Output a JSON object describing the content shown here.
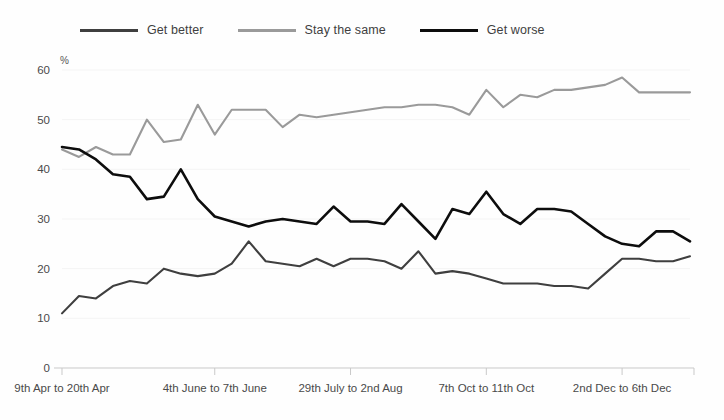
{
  "legend": {
    "items": [
      {
        "label": "Get better",
        "color": "#3f3f3f",
        "key": "get_better"
      },
      {
        "label": "Stay the same",
        "color": "#9a9a9a",
        "key": "stay_the_same"
      },
      {
        "label": "Get worse",
        "color": "#0d0d0d",
        "key": "get_worse"
      }
    ]
  },
  "axes": {
    "y_unit_label": "%",
    "y_ticks": [
      0,
      10,
      20,
      30,
      40,
      50,
      60
    ],
    "x_ticks": [
      {
        "label": "9th Apr to 20th Apr",
        "index": 0
      },
      {
        "label": "4th June to 7th June",
        "index": 9
      },
      {
        "label": "29th July to 2nd Aug",
        "index": 17
      },
      {
        "label": "7th Oct to 11th Oct",
        "index": 25
      },
      {
        "label": "2nd Dec to 6th Dec",
        "index": 33
      }
    ]
  },
  "chart_data": {
    "type": "line",
    "title": "",
    "subtitle": "",
    "xlabel": "",
    "ylabel": "%",
    "ylim": [
      0,
      60
    ],
    "grid": false,
    "legend_position": "top-left",
    "x_tick_labels": [
      "9th Apr to 20th Apr",
      "4th June to 7th June",
      "29th July to 2nd Aug",
      "7th Oct to 11th Oct",
      "2nd Dec to 6th Dec"
    ],
    "x_tick_indices": [
      0,
      9,
      17,
      25,
      33
    ],
    "n_points": 38,
    "series": [
      {
        "name": "Get better",
        "color": "#3f3f3f",
        "values": [
          11,
          14.5,
          14,
          16.5,
          17.5,
          17,
          20,
          19,
          18.5,
          19,
          21,
          25.5,
          21.5,
          21,
          20.5,
          22,
          20.5,
          22,
          22,
          21.5,
          20,
          23.5,
          19,
          19.5,
          19,
          18,
          17,
          17,
          17,
          16.5,
          16.5,
          16,
          19,
          22,
          22,
          21.5,
          21.5,
          22.5
        ]
      },
      {
        "name": "Stay the same",
        "color": "#9a9a9a",
        "values": [
          44,
          42.5,
          44.5,
          43,
          43,
          50,
          45.5,
          46,
          53,
          47,
          52,
          52,
          52,
          48.5,
          51,
          50.5,
          51,
          51.5,
          52,
          52.5,
          52.5,
          53,
          53,
          52.5,
          51,
          56,
          52.5,
          55,
          54.5,
          56,
          56,
          56.5,
          57,
          58.5,
          55.5,
          55.5,
          55.5,
          55.5
        ]
      },
      {
        "name": "Get worse",
        "color": "#0d0d0d",
        "values": [
          44.5,
          44,
          42,
          39,
          38.5,
          34,
          34.5,
          40,
          34,
          30.5,
          29.5,
          28.5,
          29.5,
          30,
          29.5,
          29,
          32.5,
          29.5,
          29.5,
          29,
          33,
          29.5,
          26,
          32,
          31,
          35.5,
          31,
          29,
          32,
          32,
          31.5,
          29,
          26.5,
          25,
          24.5,
          27.5,
          27.5,
          25.5
        ]
      }
    ]
  },
  "plot_geometry": {
    "left": 62,
    "right": 690,
    "top": 70,
    "bottom": 368
  }
}
